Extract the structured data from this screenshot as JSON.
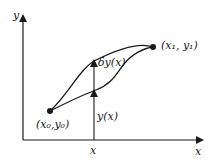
{
  "diagram": {
    "type": "calculus-of-variations-paths",
    "axes": {
      "y_label": "y",
      "x_label": "x"
    },
    "points": {
      "start": {
        "label": "(x₀,y₀)"
      },
      "end": {
        "label": "(x₁, y₁)"
      }
    },
    "vertical_marker": {
      "x_label": "x",
      "base_label": "y(x)",
      "variation_label": "δy(x)"
    },
    "curves": [
      "upper varied path",
      "lower path y(x)"
    ],
    "colors": {
      "stroke": "#1a1a1a",
      "background": "#ffffff"
    }
  }
}
